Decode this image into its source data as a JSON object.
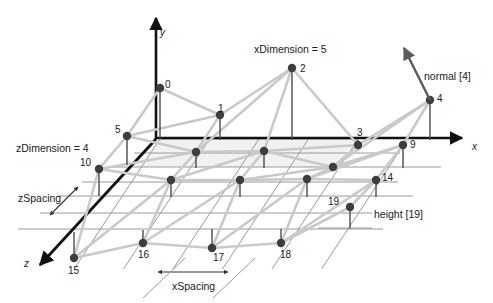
{
  "figure": {
    "type": "3d-grid-diagram",
    "width": 493,
    "height": 303,
    "background": "#ffffff"
  },
  "colors": {
    "axis": "#111111",
    "mesh": "#c9c9c9",
    "gridline": "#9a9a9a",
    "node": "#3d3d3d",
    "stem": "#4a4a4a",
    "text": "#1a1a1a",
    "normal_arrow": "#5a5a5a",
    "plane_fill": "#efefef"
  },
  "axes": [
    {
      "name": "y",
      "label": "y",
      "label_x": 160,
      "label_y": 27
    },
    {
      "name": "x",
      "label": "x",
      "label_x": 472,
      "label_y": 141
    },
    {
      "name": "z",
      "label": "z",
      "label_x": 24,
      "label_y": 258
    }
  ],
  "annotations": [
    {
      "name": "x-dimension",
      "text": "xDimension = 5",
      "x": 254,
      "y": 44
    },
    {
      "name": "z-dimension",
      "text": "zDimension = 4",
      "x": 16,
      "y": 143
    },
    {
      "name": "z-spacing",
      "text": "zSpacing",
      "x": 18,
      "y": 193
    },
    {
      "name": "x-spacing",
      "text": "xSpacing",
      "x": 172,
      "y": 281
    },
    {
      "name": "normal-vector",
      "text": "normal [4]",
      "x": 424,
      "y": 71
    },
    {
      "name": "height-value",
      "text": "height [19]",
      "x": 374,
      "y": 209
    }
  ],
  "grid": {
    "x_dimension": 5,
    "z_dimension": 4,
    "vertex_count": 20
  },
  "chart_data": {
    "type": "scatter",
    "xlabel": "x",
    "ylabel": "y",
    "zlabel": "z",
    "x_dimension": 5,
    "z_dimension": 4,
    "vertices": [
      {
        "id": 0,
        "px": 160,
        "py": 88,
        "bx": 160,
        "by": 139,
        "label": "0",
        "lx": 165,
        "ly": 80,
        "show_label": true
      },
      {
        "id": 1,
        "px": 220,
        "py": 115,
        "bx": 220,
        "by": 140,
        "label": "1",
        "lx": 218,
        "ly": 104,
        "show_label": true
      },
      {
        "id": 2,
        "px": 292,
        "py": 68,
        "bx": 292,
        "by": 140,
        "label": "2",
        "lx": 300,
        "ly": 64,
        "show_label": true
      },
      {
        "id": 3,
        "px": 358,
        "py": 145,
        "bx": 358,
        "by": 140,
        "label": "3",
        "lx": 357,
        "ly": 128,
        "show_label": true
      },
      {
        "id": 4,
        "px": 430,
        "py": 100,
        "bx": 430,
        "by": 140,
        "label": "4",
        "lx": 437,
        "ly": 94,
        "show_label": true
      },
      {
        "id": 5,
        "px": 127,
        "py": 136,
        "bx": 127,
        "by": 165,
        "label": "5",
        "lx": 115,
        "ly": 125,
        "show_label": true
      },
      {
        "id": 6,
        "px": 196,
        "py": 152,
        "bx": 196,
        "by": 168,
        "label": "6",
        "lx": 194,
        "ly": 143,
        "show_label": false
      },
      {
        "id": 7,
        "px": 264,
        "py": 151,
        "bx": 264,
        "by": 168,
        "label": "7",
        "lx": 262,
        "ly": 142,
        "show_label": false
      },
      {
        "id": 8,
        "px": 333,
        "py": 167,
        "bx": 333,
        "by": 168,
        "label": "8",
        "lx": 331,
        "ly": 158,
        "show_label": false
      },
      {
        "id": 9,
        "px": 403,
        "py": 145,
        "bx": 403,
        "by": 168,
        "label": "9",
        "lx": 410,
        "ly": 140,
        "show_label": true
      },
      {
        "id": 10,
        "px": 99,
        "py": 169,
        "bx": 99,
        "by": 196,
        "label": "10",
        "lx": 80,
        "ly": 158,
        "show_label": true
      },
      {
        "id": 11,
        "px": 171,
        "py": 180,
        "bx": 171,
        "by": 197,
        "label": "11",
        "lx": 169,
        "ly": 171,
        "show_label": false
      },
      {
        "id": 12,
        "px": 240,
        "py": 180,
        "bx": 240,
        "by": 197,
        "label": "12",
        "lx": 238,
        "ly": 171,
        "show_label": false
      },
      {
        "id": 13,
        "px": 307,
        "py": 179,
        "bx": 307,
        "by": 197,
        "label": "13",
        "lx": 305,
        "ly": 170,
        "show_label": false
      },
      {
        "id": 14,
        "px": 376,
        "py": 180,
        "bx": 376,
        "by": 197,
        "label": "14",
        "lx": 382,
        "ly": 173,
        "show_label": true
      },
      {
        "id": 15,
        "px": 74,
        "py": 258,
        "bx": 74,
        "by": 232,
        "label": "15",
        "lx": 68,
        "ly": 266,
        "show_label": true
      },
      {
        "id": 16,
        "px": 143,
        "py": 243,
        "bx": 143,
        "by": 230,
        "label": "16",
        "lx": 138,
        "ly": 250,
        "show_label": true
      },
      {
        "id": 17,
        "px": 212,
        "py": 248,
        "bx": 212,
        "by": 229,
        "label": "17",
        "lx": 213,
        "ly": 253,
        "show_label": true
      },
      {
        "id": 18,
        "px": 281,
        "py": 243,
        "bx": 281,
        "by": 229,
        "label": "18",
        "lx": 280,
        "ly": 250,
        "show_label": true
      },
      {
        "id": 19,
        "px": 350,
        "py": 207,
        "bx": 350,
        "by": 229,
        "label": "19",
        "lx": 328,
        "ly": 197,
        "show_label": true
      }
    ],
    "rows": [
      [
        0,
        1,
        2,
        3,
        4
      ],
      [
        5,
        6,
        7,
        8,
        9
      ],
      [
        10,
        11,
        12,
        13,
        14
      ],
      [
        15,
        16,
        17,
        18,
        19
      ]
    ]
  }
}
